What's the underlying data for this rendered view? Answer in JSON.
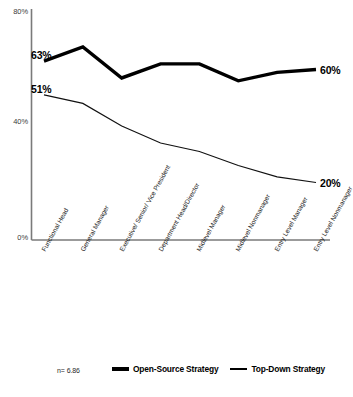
{
  "chart_data": {
    "type": "line",
    "title": "",
    "xlabel": "",
    "ylabel": "",
    "ylim": [
      0,
      80
    ],
    "yticks": [
      "0%",
      "40%",
      "80%"
    ],
    "ytick_values": [
      0,
      40,
      80
    ],
    "grid": false,
    "legend_position": "bottom",
    "categories": [
      "Functional Head",
      "General Manager",
      "Executive/ Senior/ Vice President",
      "Department Head/Director",
      "Midlevel Manager",
      "Midlevel Nonmanager",
      "Entry Level Manager",
      "Entry Level Nonmanager"
    ],
    "series": [
      {
        "name": "Open-Source Strategy",
        "values": [
          63,
          68,
          57,
          62,
          62,
          56,
          59,
          60
        ],
        "style": "thick",
        "start_label": "63%",
        "end_label": "60%"
      },
      {
        "name": "Top-Down Strategy",
        "values": [
          51,
          48,
          40,
          34,
          31,
          26,
          22,
          20
        ],
        "style": "thin",
        "start_label": "51%",
        "end_label": "20%"
      }
    ],
    "annotations": {
      "sample_size": "n= 6.86"
    }
  },
  "legend": {
    "items": [
      {
        "label": "Open-Source Strategy",
        "style": "thick"
      },
      {
        "label": "Top-Down Strategy",
        "style": "thin"
      }
    ]
  },
  "footer": {
    "sample_size": "n= 6.86",
    "source": ""
  }
}
